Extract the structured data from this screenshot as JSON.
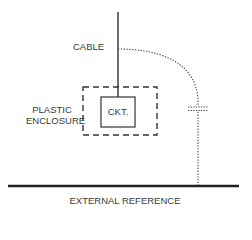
{
  "diagram": {
    "labels": {
      "cable": "CABLE",
      "enclosure_line1": "PLASTIC",
      "enclosure_line2": "ENCLOSURE",
      "circuit": "CKT.",
      "reference": "EXTERNAL REFERENCE"
    },
    "colors": {
      "line": "#222222",
      "text": "#3a3a3a",
      "background": "#ffffff"
    },
    "elements": [
      {
        "id": "cable",
        "type": "solid-line"
      },
      {
        "id": "plastic-enclosure",
        "type": "dashed-rectangle"
      },
      {
        "id": "circuit-box",
        "type": "solid-rectangle"
      },
      {
        "id": "stray-capacitance-path",
        "type": "dotted-curve"
      },
      {
        "id": "capacitor",
        "type": "dotted-capacitor-symbol"
      },
      {
        "id": "external-reference-plane",
        "type": "thick-line"
      }
    ]
  }
}
